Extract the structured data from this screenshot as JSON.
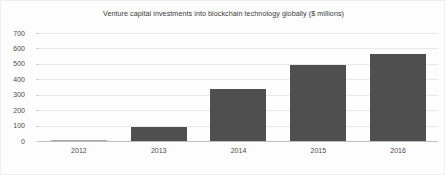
{
  "chart_data": {
    "type": "bar",
    "title": "Venture capital investments into blockchain technology globally ($ millions)",
    "xlabel": "",
    "ylabel": "",
    "categories": [
      "2012",
      "2013",
      "2014",
      "2015",
      "2016"
    ],
    "values": [
      2,
      93,
      340,
      495,
      565
    ],
    "ylim": [
      0,
      700
    ],
    "yticks": [
      0,
      100,
      200,
      300,
      400,
      500,
      600,
      700
    ],
    "ytick_labels": [
      "0",
      "100",
      "200",
      "300",
      "400",
      "500",
      "600",
      "700"
    ],
    "grid": true,
    "legend": null,
    "legend_position": "none",
    "series": [
      {
        "name": "Venture capital investments",
        "values": [
          2,
          93,
          340,
          495,
          565
        ],
        "color": "#4f4f4f"
      }
    ],
    "units": "$ millions",
    "colors": {
      "bar": "#4f4f4f",
      "gridline": "#e9e9e9",
      "axis": "#bdbdbd",
      "background": "#fdfdfd",
      "text": "#4a4a4a",
      "title_text": "#3a3a3a"
    }
  }
}
